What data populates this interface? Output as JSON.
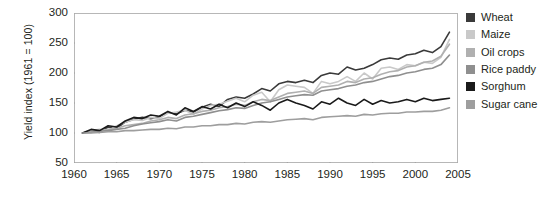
{
  "chart_data": {
    "type": "line",
    "title": "",
    "xlabel": "",
    "ylabel": "Yield index (1961 = 100)",
    "xlim": [
      1960,
      2005
    ],
    "ylim": [
      50,
      300
    ],
    "grid": false,
    "legend_position": "right",
    "xticks": [
      1960,
      1965,
      1970,
      1975,
      1980,
      1985,
      1990,
      1995,
      2000,
      2005
    ],
    "yticks": [
      50,
      100,
      150,
      200,
      250,
      300
    ],
    "x": [
      1961,
      1962,
      1963,
      1964,
      1965,
      1966,
      1967,
      1968,
      1969,
      1970,
      1971,
      1972,
      1973,
      1974,
      1975,
      1976,
      1977,
      1978,
      1979,
      1980,
      1981,
      1982,
      1983,
      1984,
      1985,
      1986,
      1987,
      1988,
      1989,
      1990,
      1991,
      1992,
      1993,
      1994,
      1995,
      1996,
      1997,
      1998,
      1999,
      2000,
      2001,
      2002,
      2003,
      2004
    ],
    "series": [
      {
        "name": "Wheat",
        "color": "#3a3a3a",
        "values": [
          100,
          103,
          101,
          110,
          108,
          118,
          123,
          126,
          124,
          127,
          134,
          132,
          138,
          135,
          143,
          148,
          144,
          156,
          160,
          158,
          165,
          174,
          170,
          182,
          186,
          184,
          188,
          184,
          196,
          200,
          198,
          210,
          205,
          208,
          214,
          222,
          225,
          223,
          230,
          232,
          238,
          234,
          244,
          268
        ]
      },
      {
        "name": "Maize",
        "color": "#c9c9c9",
        "values": [
          100,
          104,
          106,
          104,
          112,
          118,
          122,
          121,
          126,
          124,
          133,
          135,
          138,
          131,
          140,
          146,
          148,
          153,
          158,
          152,
          163,
          168,
          152,
          172,
          180,
          178,
          176,
          166,
          186,
          182,
          186,
          194,
          186,
          200,
          190,
          208,
          210,
          206,
          214,
          212,
          218,
          216,
          226,
          256
        ]
      },
      {
        "name": "Oil crops",
        "color": "#b0b0b0",
        "values": [
          100,
          102,
          104,
          106,
          108,
          112,
          114,
          116,
          120,
          122,
          126,
          124,
          130,
          132,
          136,
          138,
          142,
          144,
          148,
          146,
          152,
          156,
          154,
          160,
          166,
          168,
          170,
          166,
          176,
          178,
          180,
          186,
          184,
          190,
          192,
          198,
          202,
          204,
          210,
          212,
          218,
          220,
          228,
          248
        ]
      },
      {
        "name": "Rice paddy",
        "color": "#8f8f8f",
        "values": [
          100,
          101,
          103,
          104,
          106,
          108,
          112,
          115,
          117,
          119,
          122,
          120,
          126,
          128,
          131,
          134,
          137,
          139,
          142,
          141,
          146,
          150,
          152,
          156,
          160,
          162,
          164,
          163,
          170,
          172,
          174,
          178,
          180,
          184,
          186,
          190,
          194,
          196,
          200,
          202,
          206,
          208,
          214,
          230
        ]
      },
      {
        "name": "Sorghum",
        "color": "#1a1a1a",
        "values": [
          100,
          106,
          104,
          112,
          110,
          120,
          126,
          124,
          130,
          128,
          136,
          130,
          142,
          136,
          144,
          140,
          148,
          142,
          150,
          144,
          152,
          146,
          138,
          150,
          156,
          150,
          146,
          140,
          152,
          148,
          158,
          150,
          146,
          156,
          148,
          154,
          150,
          152,
          156,
          152,
          158,
          154,
          156,
          158
        ]
      },
      {
        "name": "Sugar cane",
        "color": "#9e9e9e",
        "values": [
          100,
          100,
          101,
          102,
          102,
          104,
          104,
          105,
          106,
          106,
          108,
          107,
          110,
          110,
          112,
          112,
          114,
          114,
          116,
          115,
          118,
          119,
          118,
          120,
          122,
          123,
          124,
          122,
          126,
          127,
          128,
          129,
          128,
          131,
          130,
          132,
          133,
          133,
          135,
          135,
          136,
          136,
          138,
          142
        ]
      }
    ]
  },
  "axes": {
    "ylabel": "Yield index (1961 = 100)",
    "ytick_labels": [
      "300",
      "250",
      "200",
      "150",
      "100",
      "50"
    ],
    "xtick_labels": [
      "1960",
      "1965",
      "1970",
      "1975",
      "1980",
      "1985",
      "1990",
      "1995",
      "2000",
      "2005"
    ]
  },
  "legend": {
    "items": [
      {
        "label": "Wheat",
        "color": "#3a3a3a"
      },
      {
        "label": "Maize",
        "color": "#c9c9c9"
      },
      {
        "label": "Oil crops",
        "color": "#b0b0b0"
      },
      {
        "label": "Rice paddy",
        "color": "#8f8f8f"
      },
      {
        "label": "Sorghum",
        "color": "#1a1a1a"
      },
      {
        "label": "Sugar cane",
        "color": "#9e9e9e"
      }
    ]
  }
}
